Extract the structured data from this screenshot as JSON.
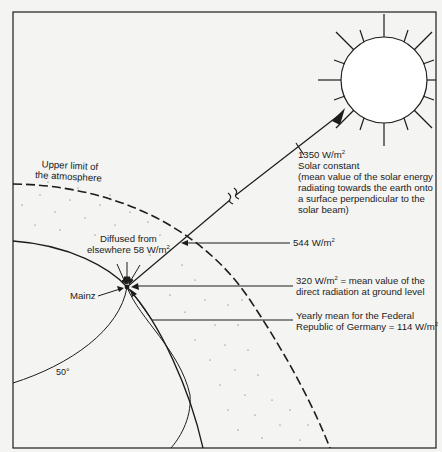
{
  "figure": {
    "type": "diagram",
    "colors": {
      "background": "#f4f4f2",
      "ink": "#1c1c1c"
    }
  },
  "labels": {
    "atmosphere_line1": "Upper limit of",
    "atmosphere_line2": "the atmosphere",
    "solar_value": "1350 W/m",
    "solar_value_exp": "2",
    "solar_title": "Solar constant",
    "solar_desc": "(mean value of the solar energy radiating towards the earth onto a surface perpendicular to the solar beam)",
    "diffused_line1": "Diffused from",
    "diffused_line2": "elsewhere 58 W/m",
    "diffused_exp": "2",
    "atm_value": "544 W/m",
    "atm_value_exp": "2",
    "ground_value": "320 W/m",
    "ground_value_exp": "2",
    "ground_desc_line1": " = mean value of the",
    "ground_desc_line2": "direct radiation at ground level",
    "yearly_line1": "Yearly mean for the Federal",
    "yearly_line2": "Republic of Germany = 114 W/m",
    "yearly_exp": "2",
    "city": "Mainz",
    "latitude": "50°"
  }
}
